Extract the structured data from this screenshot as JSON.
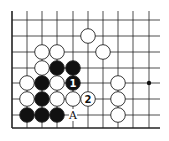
{
  "diagram": {
    "type": "go-board-fragment",
    "grid": {
      "x": [
        12,
        27,
        42,
        57,
        73,
        88,
        103,
        118,
        133,
        149
      ],
      "y": [
        20,
        36,
        52,
        68,
        83,
        99,
        115
      ],
      "edge_left_x": 12,
      "edge_bottom_y": 128,
      "top_y": 11,
      "right_x": 160
    },
    "stones": [
      {
        "color": "white",
        "col": 5,
        "row": 1
      },
      {
        "color": "white",
        "col": 6,
        "row": 2
      },
      {
        "color": "white",
        "col": 2,
        "row": 2
      },
      {
        "color": "white",
        "col": 3,
        "row": 2
      },
      {
        "color": "white",
        "col": 2,
        "row": 3
      },
      {
        "color": "black",
        "col": 3,
        "row": 3
      },
      {
        "color": "black",
        "col": 4,
        "row": 3
      },
      {
        "color": "white",
        "col": 1,
        "row": 4
      },
      {
        "color": "black",
        "col": 2,
        "row": 4
      },
      {
        "color": "white",
        "col": 3,
        "row": 4
      },
      {
        "color": "black",
        "col": 4,
        "row": 4,
        "label": "1"
      },
      {
        "color": "white",
        "col": 7,
        "row": 4
      },
      {
        "color": "white",
        "col": 1,
        "row": 5
      },
      {
        "color": "black",
        "col": 2,
        "row": 5
      },
      {
        "color": "white",
        "col": 3,
        "row": 5
      },
      {
        "color": "white",
        "col": 4,
        "row": 5
      },
      {
        "color": "white",
        "col": 5,
        "row": 5,
        "label": "2"
      },
      {
        "color": "white",
        "col": 7,
        "row": 5
      },
      {
        "color": "black",
        "col": 1,
        "row": 6
      },
      {
        "color": "black",
        "col": 2,
        "row": 6
      },
      {
        "color": "black",
        "col": 3,
        "row": 6
      },
      {
        "color": "white",
        "col": 7,
        "row": 6
      }
    ],
    "marks": [
      {
        "type": "letter",
        "text": "A",
        "col": 4,
        "row": 6
      },
      {
        "type": "star-point",
        "col": 9,
        "row": 4
      }
    ]
  }
}
